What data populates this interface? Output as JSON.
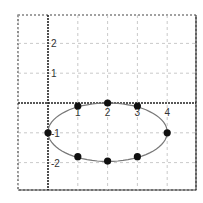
{
  "chart_data": {
    "type": "scatter",
    "title": "",
    "xlabel": "",
    "ylabel": "",
    "xlim": [
      -1,
      5
    ],
    "ylim": [
      -3,
      3
    ],
    "grid": true,
    "x_ticks": [
      1,
      2,
      3,
      4
    ],
    "y_ticks": [
      2,
      1,
      -1,
      -2
    ],
    "x_tick_labels": [
      "1",
      "2",
      "3",
      "4"
    ],
    "y_tick_labels": [
      "2",
      "1",
      "-1",
      "-2"
    ],
    "series": [
      {
        "name": "ellipse",
        "style": "closed smooth curve with points",
        "points": [
          {
            "x": 0,
            "y": -1
          },
          {
            "x": 1,
            "y": -0.1
          },
          {
            "x": 2,
            "y": 0
          },
          {
            "x": 3,
            "y": -0.1
          },
          {
            "x": 4,
            "y": -1
          },
          {
            "x": 3,
            "y": -1.8
          },
          {
            "x": 2,
            "y": -1.95
          },
          {
            "x": 1,
            "y": -1.8
          }
        ]
      }
    ],
    "legend": null
  },
  "colors": {
    "curve": "#777777",
    "points": "#111111",
    "grid": "#bbbbbb",
    "axes": "#222222",
    "frame": "#444444"
  }
}
